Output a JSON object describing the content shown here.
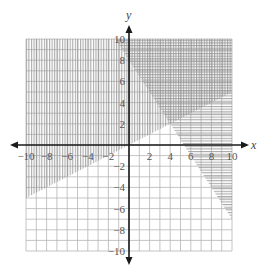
{
  "chart_data": {
    "type": "inequality-graph",
    "title": "",
    "xlabel": "x",
    "ylabel": "y",
    "xlim": [
      -10,
      10
    ],
    "ylim": [
      -10,
      10
    ],
    "grid": true,
    "grid_step": 1,
    "x_ticks": [
      -10,
      -8,
      -6,
      -4,
      -2,
      2,
      4,
      6,
      8,
      10
    ],
    "y_ticks": [
      10,
      8,
      6,
      4,
      2,
      -2,
      -4,
      -6,
      -8,
      -10
    ],
    "x_tick_labels": [
      "−10",
      "−8",
      "−6",
      "−4",
      "−2",
      "2",
      "4",
      "6",
      "8",
      "10"
    ],
    "y_tick_labels": [
      "10",
      "8",
      "6",
      "4",
      "2",
      "−2",
      "−4",
      "−6",
      "−8",
      "−10"
    ],
    "boundary_lines": [
      {
        "name": "line-1",
        "equation": "y = 0.5x",
        "slope": 0.5,
        "intercept": 0,
        "points": [
          [
            -10,
            -5
          ],
          [
            10,
            5
          ]
        ]
      },
      {
        "name": "line-2",
        "equation": "y = -1.5x + 8",
        "slope": -1.5,
        "intercept": 8,
        "points": [
          [
            0,
            8
          ],
          [
            10,
            -7
          ]
        ]
      }
    ],
    "regions": [
      {
        "name": "region-vertical-hatch",
        "inequality": "y >= 0.5x",
        "hatch": "vertical"
      },
      {
        "name": "region-horizontal-hatch",
        "inequality": "y >= -1.5x + 8",
        "hatch": "horizontal"
      }
    ],
    "solution_region": "cross-hatched intersection, upper right",
    "intersection_point": [
      4,
      2
    ]
  },
  "colors": {
    "grid": "#b5b5b5",
    "hatch": "#8a8a8a",
    "axis": "#1a1a1a",
    "text": "#555555"
  }
}
